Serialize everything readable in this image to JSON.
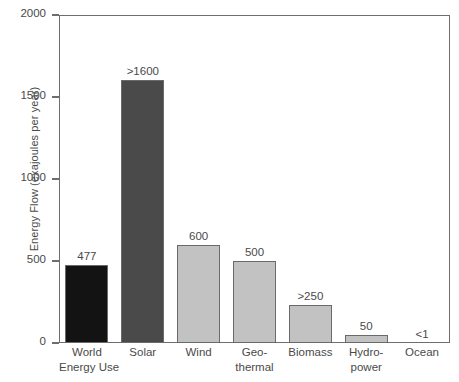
{
  "chart_data": {
    "type": "bar",
    "title": "",
    "xlabel": "",
    "ylabel": "Energy Flow (exajoules per year)",
    "ylim": [
      0,
      2000
    ],
    "yticks": [
      0,
      500,
      1000,
      1500,
      2000
    ],
    "ytick_labels": [
      "0",
      "500",
      "1000",
      "1500",
      "2000"
    ],
    "grid": false,
    "legend": null,
    "categories": [
      "World Energy Use",
      "Solar",
      "Wind",
      "Geo-thermal",
      "Biomass",
      "Hydro-power",
      "Ocean"
    ],
    "category_lines": [
      [
        "World",
        "Energy Use"
      ],
      [
        "Solar"
      ],
      [
        "Wind"
      ],
      [
        "Geo-",
        "thermal"
      ],
      [
        "Biomass"
      ],
      [
        "Hydro-",
        "power"
      ],
      [
        "Ocean"
      ]
    ],
    "values": [
      477,
      1604,
      600,
      500,
      232,
      50,
      0.5
    ],
    "data_labels": [
      "477",
      ">1600",
      "600",
      "500",
      ">250",
      "50",
      "<1"
    ],
    "bar_colors": [
      "#131313",
      "#4a4a4a",
      "#c2c2c2",
      "#c2c2c2",
      "#c2c2c2",
      "#c2c2c2",
      "#c2c2c2"
    ],
    "bar_edge_color": "#6a6a6a",
    "axis_color": "#6e6e6e",
    "text_color": "#4a4a4a",
    "background_color": "#ffffff"
  }
}
